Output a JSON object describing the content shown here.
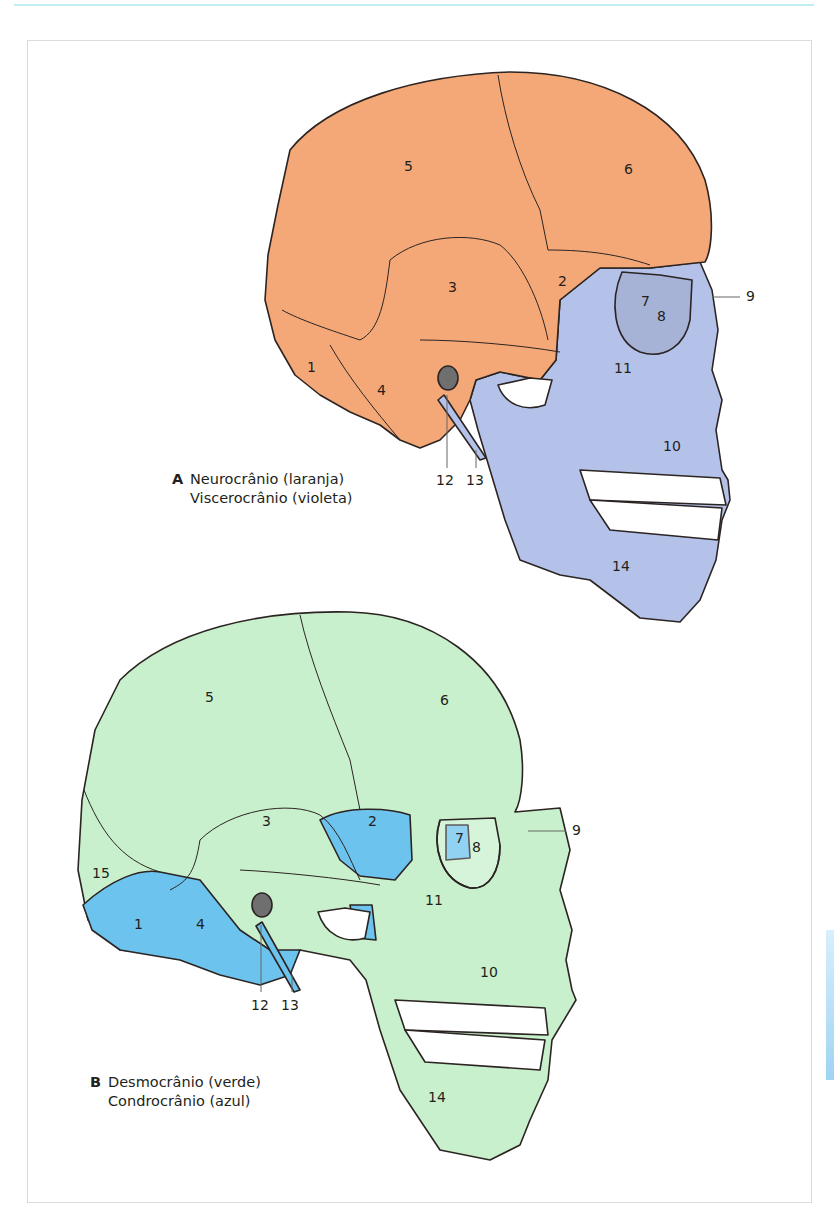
{
  "figure_a": {
    "letter": "A",
    "line1": "Neurocrânio (laranja)",
    "line2": "Viscerocrânio (violeta)",
    "colors": {
      "neurocranium": "#f5a877",
      "viscerocranium": "#b4c2ea",
      "teeth": "#ffffff",
      "outline": "#2b2422"
    },
    "labels": [
      "1",
      "2",
      "3",
      "4",
      "5",
      "6",
      "7",
      "8",
      "9",
      "10",
      "11",
      "12",
      "13",
      "14"
    ]
  },
  "figure_b": {
    "letter": "B",
    "line1": "Desmocrânio (verde)",
    "line2": "Condrocrânio (azul)",
    "colors": {
      "desmocranium": "#c9f0cc",
      "chondrocranium": "#6cc3ee",
      "teeth": "#ffffff",
      "outline": "#2b2422"
    },
    "labels": [
      "1",
      "2",
      "3",
      "4",
      "5",
      "6",
      "7",
      "8",
      "9",
      "10",
      "11",
      "12",
      "13",
      "14",
      "15"
    ]
  },
  "page": {
    "frame_border": "#d9dcdd",
    "top_rule": "#bfeef5",
    "side_tab": "#9fd4f4"
  }
}
